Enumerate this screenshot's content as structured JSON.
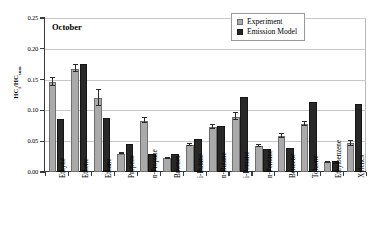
{
  "chart_data": {
    "type": "bar",
    "title": "October",
    "xlabel": "",
    "ylabel": "HC_i/HC_sum",
    "ylabel_main": "HC",
    "ylabel_sub1": "i",
    "ylabel_mid": "/HC",
    "ylabel_sub2": "sum",
    "ylim": [
      0.0,
      0.25
    ],
    "ytick_labels": [
      "0.00",
      "0.05",
      "0.10",
      "0.15",
      "0.20",
      "0.25"
    ],
    "ytick_values": [
      0.0,
      0.05,
      0.1,
      0.15,
      0.2,
      0.25
    ],
    "grid": true,
    "legend_position": "top-right",
    "categories": [
      "Ethyne",
      "Ethene",
      "Ethane",
      "Propene",
      "n-Propane",
      "Butenes",
      "i-Butane",
      "n-Butane",
      "i-Pentane",
      "n-Pentane",
      "Benzene",
      "Toluene",
      "Ethylbenzene",
      "Xylenes"
    ],
    "series": [
      {
        "name": "Experiment",
        "color": "#aaaaaa",
        "values": [
          0.146,
          0.168,
          0.12,
          0.03,
          0.083,
          0.022,
          0.044,
          0.073,
          0.09,
          0.042,
          0.058,
          0.078,
          0.016,
          0.047
        ],
        "errors": [
          0.007,
          0.006,
          0.013,
          0.001,
          0.004,
          0.001,
          0.002,
          0.003,
          0.005,
          0.002,
          0.003,
          0.004,
          0.001,
          0.004
        ]
      },
      {
        "name": "Emission Model",
        "color": "#282828",
        "values": [
          0.086,
          0.176,
          0.087,
          0.046,
          0.029,
          0.03,
          0.053,
          0.075,
          0.122,
          0.038,
          0.039,
          0.113,
          0.018,
          0.11
        ],
        "errors": [
          0,
          0,
          0,
          0,
          0,
          0,
          0,
          0,
          0,
          0,
          0,
          0,
          0,
          0
        ]
      }
    ]
  },
  "legend": {
    "items": [
      {
        "label": "Experiment",
        "color": "#aaaaaa"
      },
      {
        "label": "Emission Model",
        "color": "#282828"
      }
    ]
  }
}
